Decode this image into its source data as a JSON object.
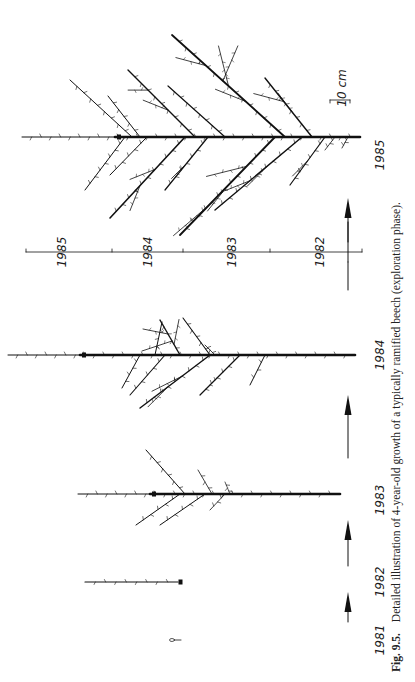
{
  "figure": {
    "caption_label": "Fig. 9.5.",
    "caption_text": "Detailed illustration of 4-year-old growth of a typically ramified beech (exploration phase).",
    "scale_bar_label": "10 cm",
    "stage_labels": [
      "1981",
      "1982",
      "1983",
      "1984",
      "1985"
    ],
    "axis_segments": [
      "1985",
      "1984",
      "1983",
      "1982"
    ]
  }
}
